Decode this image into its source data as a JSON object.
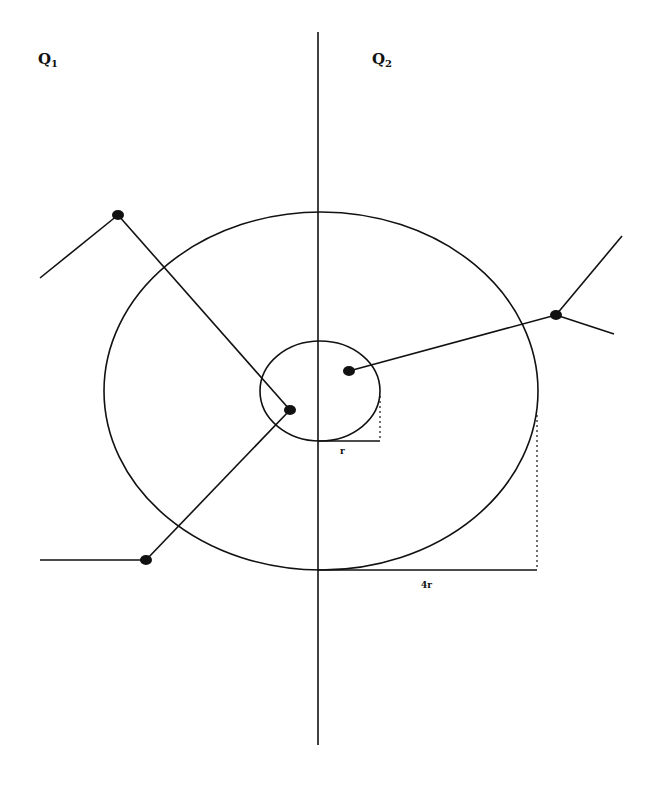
{
  "labels": {
    "q1": {
      "letter": "Q",
      "sub": "1"
    },
    "q2": {
      "letter": "Q",
      "sub": "2"
    },
    "inner_radius": "r",
    "outer_radius": "4r"
  },
  "colors": {
    "stroke": "#111111",
    "background": "#ffffff"
  },
  "geometry": {
    "axis": {
      "x": 318,
      "y1": 32,
      "y2": 745
    },
    "outer_circle": {
      "cx": 321,
      "cy": 391,
      "rx": 217,
      "ry": 179
    },
    "inner_circle": {
      "cx": 320,
      "cy": 391,
      "rx": 60,
      "ry": 50
    },
    "nodes": [
      {
        "id": "n1",
        "x": 118,
        "y": 215
      },
      {
        "id": "n2",
        "x": 290,
        "y": 410
      },
      {
        "id": "n3",
        "x": 146,
        "y": 560
      },
      {
        "id": "n4",
        "x": 349,
        "y": 371
      },
      {
        "id": "n5",
        "x": 556,
        "y": 315
      }
    ],
    "edges": [
      {
        "from": [
          40,
          278
        ],
        "to": [
          118,
          215
        ]
      },
      {
        "from": [
          118,
          215
        ],
        "to": [
          290,
          410
        ]
      },
      {
        "from": [
          290,
          410
        ],
        "to": [
          146,
          560
        ]
      },
      {
        "from": [
          40,
          560
        ],
        "to": [
          146,
          560
        ]
      },
      {
        "from": [
          349,
          371
        ],
        "to": [
          556,
          315
        ]
      },
      {
        "from": [
          556,
          315
        ],
        "to": [
          622,
          236
        ]
      },
      {
        "from": [
          556,
          315
        ],
        "to": [
          614,
          334
        ]
      }
    ],
    "inner_radius_marker": {
      "x1": 318,
      "x2": 380,
      "y": 441,
      "dash_top": 396
    },
    "outer_radius_marker": {
      "x1": 318,
      "x2": 537,
      "y": 570,
      "dash_top": 415
    }
  }
}
